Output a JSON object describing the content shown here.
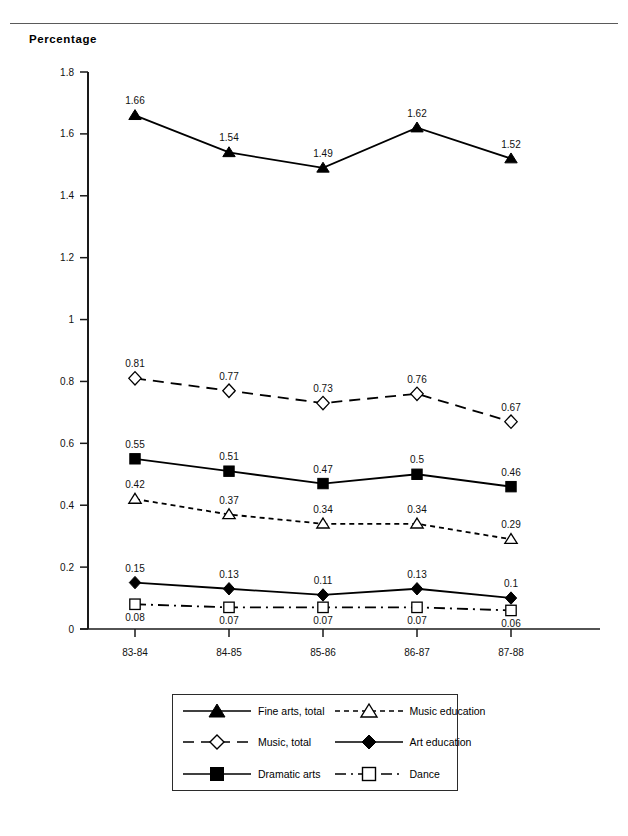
{
  "header": {
    "y_axis_title": "Percentage"
  },
  "chart_data": {
    "type": "line",
    "title": "",
    "xlabel": "",
    "ylabel": "Percentage",
    "ylim": [
      0,
      1.8
    ],
    "yticks": [
      "0",
      "0.2",
      "0.4",
      "0.6",
      "0.8",
      "1",
      "1.2",
      "1.4",
      "1.6",
      "1.8"
    ],
    "ytick_values": [
      0,
      0.2,
      0.4,
      0.6,
      0.8,
      1,
      1.2,
      1.4,
      1.6,
      1.8
    ],
    "grid": false,
    "legend_position": "bottom",
    "categories": [
      "83-84",
      "84-85",
      "85-86",
      "86-87",
      "87-88"
    ],
    "series": [
      {
        "name": "Fine arts, total",
        "marker": "filled-triangle",
        "line": "solid",
        "color": "#000000",
        "values": [
          1.66,
          1.54,
          1.49,
          1.62,
          1.52
        ],
        "labels": [
          "1.66",
          "1.54",
          "1.49",
          "1.62",
          "1.52"
        ],
        "label_pos": "above"
      },
      {
        "name": "Music, total",
        "marker": "open-diamond",
        "line": "dashed",
        "color": "#000000",
        "values": [
          0.81,
          0.77,
          0.73,
          0.76,
          0.67
        ],
        "labels": [
          "0.81",
          "0.77",
          "0.73",
          "0.76",
          "0.67"
        ],
        "label_pos": "above"
      },
      {
        "name": "Dramatic arts",
        "marker": "filled-square",
        "line": "solid",
        "color": "#000000",
        "values": [
          0.55,
          0.51,
          0.47,
          0.5,
          0.46
        ],
        "labels": [
          "0.55",
          "0.51",
          "0.47",
          "0.5",
          "0.46"
        ],
        "label_pos": "above"
      },
      {
        "name": "Music education",
        "marker": "open-triangle",
        "line": "fine-dashed",
        "color": "#000000",
        "values": [
          0.42,
          0.37,
          0.34,
          0.34,
          0.29
        ],
        "labels": [
          "0.42",
          "0.37",
          "0.34",
          "0.34",
          "0.29"
        ],
        "label_pos": "above"
      },
      {
        "name": "Art education",
        "marker": "filled-diamond",
        "line": "solid",
        "color": "#000000",
        "values": [
          0.15,
          0.13,
          0.11,
          0.13,
          0.1
        ],
        "labels": [
          "0.15",
          "0.13",
          "0.11",
          "0.13",
          "0.1"
        ],
        "label_pos": "above"
      },
      {
        "name": "Dance",
        "marker": "open-square",
        "line": "dash-dot",
        "color": "#000000",
        "values": [
          0.08,
          0.07,
          0.07,
          0.07,
          0.06
        ],
        "labels": [
          "0.08",
          "0.07",
          "0.07",
          "0.07",
          "0.06"
        ],
        "label_pos": "below"
      }
    ]
  },
  "legend": {
    "items": [
      {
        "label": "Fine arts, total",
        "marker": "filled-triangle",
        "line": "solid"
      },
      {
        "label": "Music education",
        "marker": "open-triangle",
        "line": "fine-dashed"
      },
      {
        "label": "Music, total",
        "marker": "open-diamond",
        "line": "dashed"
      },
      {
        "label": "Art education",
        "marker": "filled-diamond",
        "line": "solid"
      },
      {
        "label": "Dramatic arts",
        "marker": "filled-square",
        "line": "solid"
      },
      {
        "label": "Dance",
        "marker": "open-square",
        "line": "dash-dot"
      }
    ]
  }
}
